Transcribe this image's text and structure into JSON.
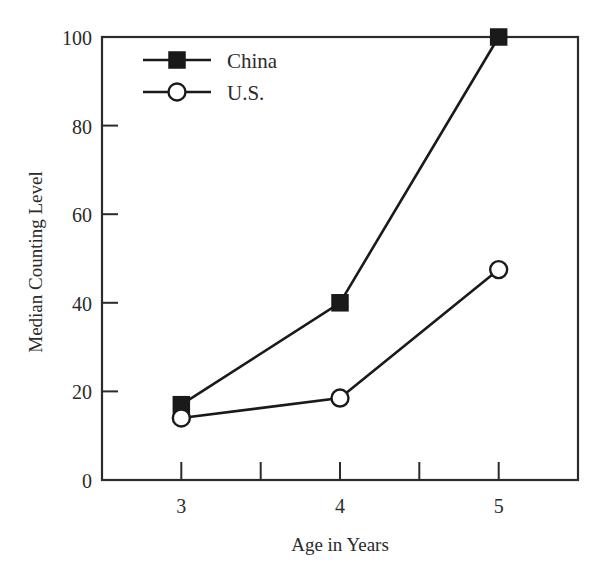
{
  "chart_data": {
    "type": "line",
    "title": "",
    "subtitle": "",
    "xlabel": "Age in Years",
    "ylabel": "Median Counting Level",
    "x": [
      3,
      4,
      5
    ],
    "categories": [
      "3",
      "4",
      "5"
    ],
    "xlim": [
      2.5,
      5.5
    ],
    "ylim": [
      0,
      100
    ],
    "xticks": [
      "3",
      "4",
      "5"
    ],
    "yticks": [
      "0",
      "20",
      "40",
      "60",
      "80",
      "100"
    ],
    "grid": false,
    "legend_position": "top-left",
    "series": [
      {
        "name": "China",
        "marker": "filled-square",
        "color": "#1a1a1a",
        "values": [
          17,
          40,
          100
        ]
      },
      {
        "name": "U.S.",
        "marker": "open-circle",
        "color": "#1a1a1a",
        "values": [
          14,
          18.5,
          47.5
        ]
      }
    ]
  },
  "axes": {
    "y_tick_labels": [
      "100",
      "80",
      "60",
      "40",
      "20",
      "0"
    ],
    "x_tick_labels": [
      "3",
      "4",
      "5"
    ],
    "y_axis_title": "Median Counting Level",
    "x_axis_title": "Age in Years"
  },
  "legend": {
    "entries": [
      {
        "label": "China",
        "marker": "filled-square"
      },
      {
        "label": "U.S.",
        "marker": "open-circle"
      }
    ]
  },
  "colors": {
    "ink": "#1a1a1a",
    "axis": "#2b2b2b",
    "background": "#ffffff"
  }
}
